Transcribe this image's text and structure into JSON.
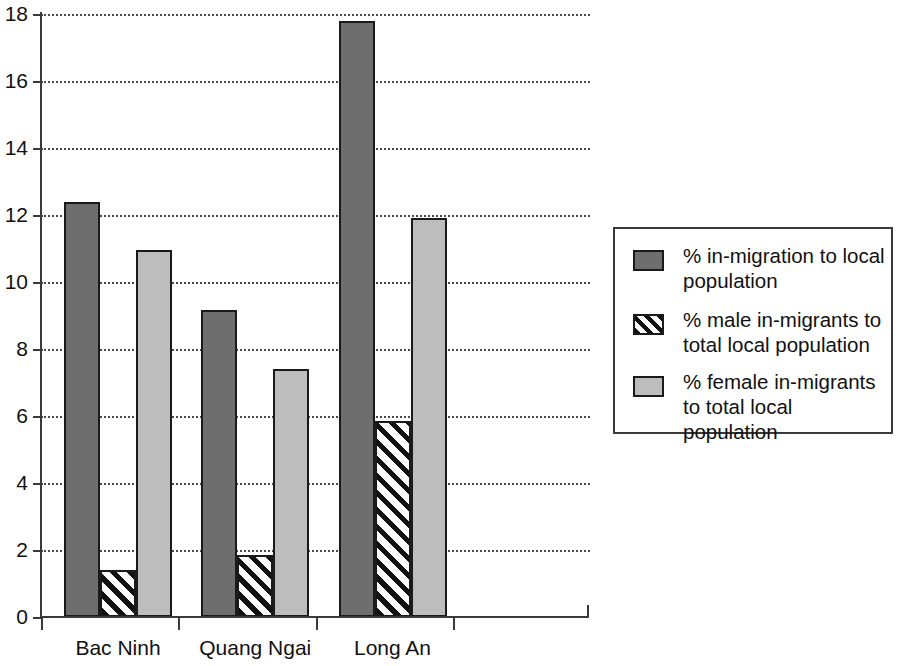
{
  "chart_data": {
    "type": "bar",
    "title": "",
    "subtitle": "",
    "xlabel": "",
    "ylabel": "",
    "categories": [
      "Bac Ninh",
      "Quang Ngai",
      "Long An"
    ],
    "series": [
      {
        "name": "% in-migration to local population",
        "key": "in_migration",
        "style": "dark",
        "color": "#6e6e6e",
        "values": [
          12.4,
          9.15,
          17.8
        ]
      },
      {
        "name": "% male in-migrants to total local population",
        "key": "male_in_migrants",
        "style": "hatch",
        "color": "#ffffff",
        "values": [
          1.4,
          1.85,
          5.85
        ]
      },
      {
        "name": "% female in-migrants to total local population",
        "key": "female_in_migrants",
        "style": "light",
        "color": "#bdbdbd",
        "values": [
          10.95,
          7.4,
          11.9
        ]
      }
    ],
    "ylim": [
      0,
      18
    ],
    "ytick_values": [
      0,
      2,
      4,
      6,
      8,
      10,
      12,
      14,
      16,
      18
    ],
    "ytick_labels": [
      "0",
      "2",
      "4",
      "6",
      "8",
      "10",
      "12",
      "14",
      "16",
      "18"
    ],
    "grid": true,
    "grid_axis": "y",
    "grid_style": "dotted",
    "legend_position": "right",
    "legend_entries": [
      {
        "swatch": "dark",
        "line1": "% in-migration to local",
        "line2": "population"
      },
      {
        "swatch": "hatch",
        "line1": "% male in-migrants to",
        "line2": "total local population"
      },
      {
        "swatch": "light",
        "line1": "% female in-migrants",
        "line2": "to total local population"
      }
    ],
    "colors": {
      "in_migration": "#6e6e6e",
      "male_in_migrants": "#ffffff",
      "female_in_migrants": "#bdbdbd",
      "outline": "#1a1a1a",
      "axis": "#3a3a3a",
      "gridline": "#4a4a4a",
      "background": "#ffffff"
    }
  }
}
